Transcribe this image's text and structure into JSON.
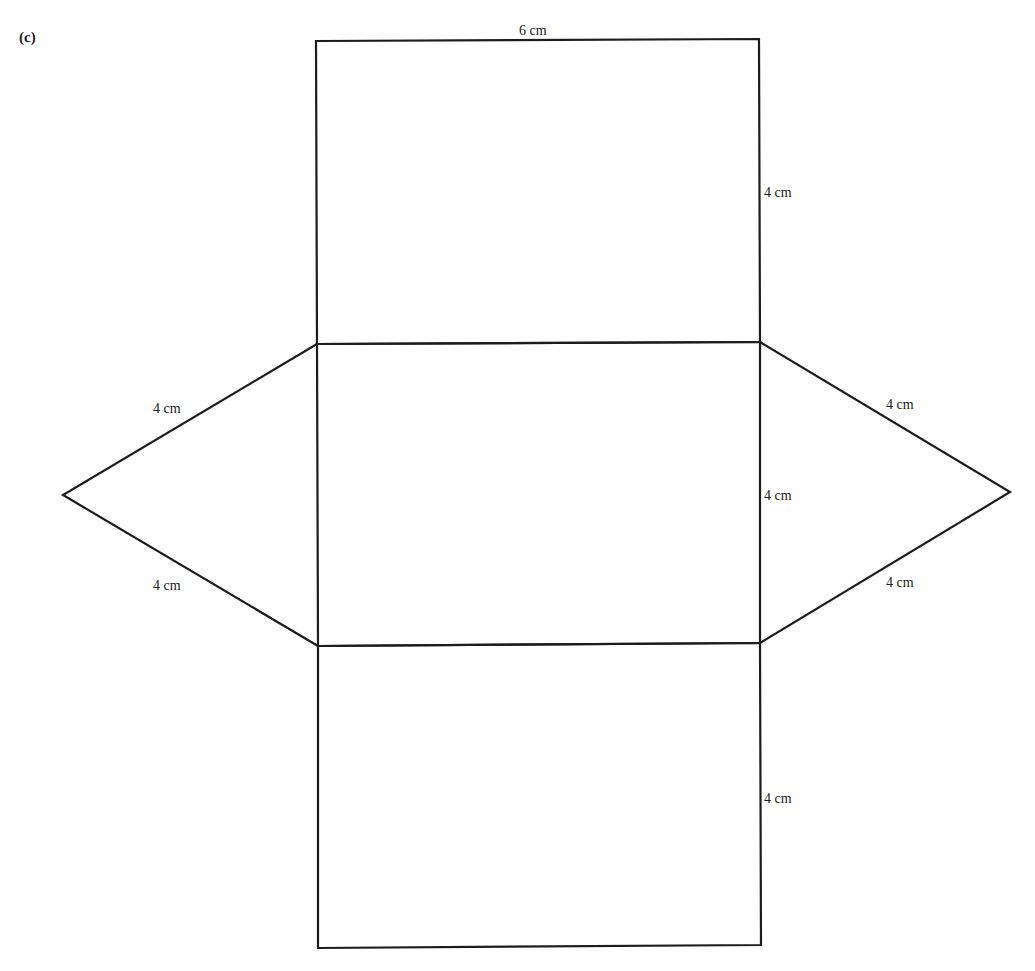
{
  "part_label": "(c)",
  "figure": {
    "type": "net of triangular prism",
    "labels": {
      "top_width": "6 cm",
      "top_rect_height": "4 cm",
      "middle_rect_height": "4 cm",
      "bottom_rect_height": "4 cm",
      "left_triangle_upper": "4 cm",
      "left_triangle_lower": "4 cm",
      "right_triangle_upper": "4 cm",
      "right_triangle_lower": "4 cm"
    },
    "stroke_color": "#1c1c1c",
    "background": "#ffffff"
  }
}
